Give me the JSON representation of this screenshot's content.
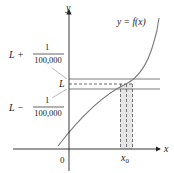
{
  "diagram": {
    "axes": {
      "x_label": "x",
      "y_label": "y",
      "origin_label": "0"
    },
    "curve": {
      "label": "y = f(x)"
    },
    "levels": {
      "upper": {
        "prefix": "L +",
        "numerator": "1",
        "denominator": "100,000"
      },
      "middle": {
        "label": "L"
      },
      "lower": {
        "prefix": "L −",
        "numerator": "1",
        "denominator": "100,000"
      }
    },
    "x_marker": {
      "label_base": "x",
      "label_sub": "0"
    },
    "colors": {
      "axis": "#222222",
      "curve": "#7a7a7a",
      "band_line": "#6b6b6b",
      "shade": "#e6e6e6",
      "dash": "#555555",
      "leader": "#aaaaaa"
    }
  }
}
